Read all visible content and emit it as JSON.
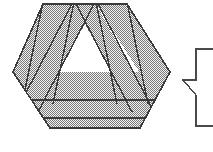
{
  "figure": {
    "canvas": {
      "width": 213,
      "height": 152,
      "background": "#ffffff"
    },
    "style": {
      "stroke_color": "#3a3a3a",
      "stroke_width": 1.4,
      "fill_pattern": "dither-50-gray",
      "fill_light": "#e9e9e9",
      "fill_dot": "#6e6e6e",
      "unfilled_color": "#ffffff"
    },
    "shapes": [
      {
        "name": "hexagon-outline",
        "type": "polygon",
        "points": "43,4 127,4 170,72 140,128 50,128 13,72"
      },
      {
        "name": "left-diagonal-band",
        "type": "polygon",
        "points": "43,4 74,4 24,100 13,72"
      },
      {
        "name": "right-diagonal-band",
        "type": "polygon",
        "points": "96,4 127,4 170,72 157,100"
      },
      {
        "name": "left-triangle-leg-band",
        "type": "polygon",
        "points": "74,4 96,4 154,110 132,110"
      },
      {
        "name": "right-triangle-leg-band",
        "type": "polygon",
        "points": "74,4 96,4 38,110 16,110"
      },
      {
        "name": "upper-horizontal-band",
        "type": "polygon",
        "points": "13,72 170,72 170,100 13,100"
      },
      {
        "name": "lower-horizontal-band",
        "type": "polygon",
        "points": "13,100 170,100 170,118 13,118"
      },
      {
        "name": "bottom-band",
        "type": "polygon",
        "points": "13,118 170,118 170,128 13,128"
      }
    ],
    "zigzag": {
      "name": "partial-zigzag-polyline",
      "points": "213,49 196,49 196,80 183,80 196,95 196,126 213,126",
      "stroke_color": "#4a4a4a",
      "stroke_width": 1.4
    }
  }
}
